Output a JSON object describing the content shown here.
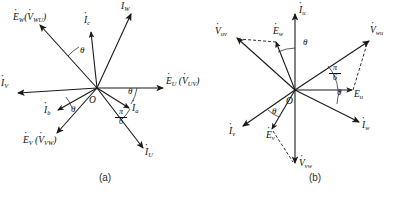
{
  "figure": {
    "background_color": "#ffffff",
    "stroke_color": "#1a1a1a",
    "panels": [
      {
        "id": "a",
        "caption": "(a)",
        "origin_label": "O",
        "labels": {
          "i_w": "I",
          "i_w_sub": "W",
          "i_c": "I",
          "i_c_sub": "c",
          "e_w": "E",
          "e_w_sub": "W",
          "v_wu_open": "(",
          "v_wu": "V",
          "v_wu_sub": "WU",
          "v_wu_close": ")",
          "i_v": "I",
          "i_v_sub": "V",
          "e_u": "E",
          "e_u_sub": "U",
          "v_uv_open": "(",
          "v_uv": "V",
          "v_uv_sub": "UV",
          "v_uv_close": ")",
          "i_a": "I",
          "i_a_sub": "a",
          "i_b": "I",
          "i_b_sub": "b",
          "e_v": "E",
          "e_v_sub": "V",
          "v_vw_open": "(",
          "v_vw": "V",
          "v_vw_sub": "VW",
          "v_vw_close": ")",
          "i_u": "I",
          "i_u_sub": "U",
          "theta_top": "θ",
          "theta_right": "θ",
          "theta_bottom": "θ",
          "pi_num": "π",
          "pi_den": "6"
        }
      },
      {
        "id": "b",
        "caption": "(b)",
        "origin_label": "O",
        "labels": {
          "i_u": "I",
          "i_u_sub": "u",
          "e_w": "E",
          "e_w_sub": "w",
          "v_uv": "V",
          "v_uv_sub": "uv",
          "v_wu": "V",
          "v_wu_sub": "wu",
          "e_u": "E",
          "e_u_sub": "u",
          "i_w": "I",
          "i_w_sub": "w",
          "i_v": "I",
          "i_v_sub": "v",
          "e_v": "E",
          "e_v_sub": "v",
          "v_vw": "V",
          "v_vw_sub": "vw",
          "theta_top": "θ",
          "theta_right": "θ",
          "theta_bottom": "θ",
          "pi_num": "π",
          "pi_den": "6"
        }
      }
    ]
  }
}
